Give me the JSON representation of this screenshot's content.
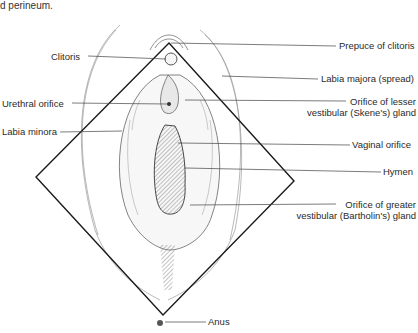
{
  "caption_fragment": "d perineum.",
  "diagram": {
    "outline_shape": "diamond",
    "labels_left": [
      {
        "text": "Clitoris"
      },
      {
        "text": "Urethral orifice"
      },
      {
        "text": "Labia minora"
      }
    ],
    "labels_right": [
      {
        "text": "Prepuce of clitoris"
      },
      {
        "text": "Labia majora (spread)"
      },
      {
        "line1": "Orifice of lesser",
        "line2": "vestibular (Skene's) gland"
      },
      {
        "text": "Vaginal orifice"
      },
      {
        "text": "Hymen"
      },
      {
        "line1": "Orifice of greater",
        "line2": "vestibular (Bartholin's) gland"
      }
    ],
    "labels_bottom": [
      {
        "text": "Anus"
      }
    ]
  },
  "colors": {
    "line": "#1a1a1a",
    "leader": "#555555",
    "sketch": "#8a8a8a"
  }
}
